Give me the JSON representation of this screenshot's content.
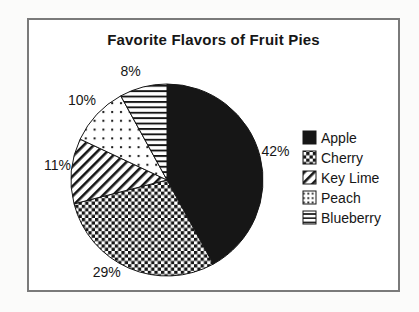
{
  "chart_data": {
    "type": "pie",
    "title": "Favorite Flavors of Fruit Pies",
    "direction": "clockwise",
    "start_angle_deg": 0,
    "legend_position": "right",
    "total_percent": 100,
    "series": [
      {
        "name": "Apple",
        "value": 42,
        "label": "42%",
        "pattern": "solid"
      },
      {
        "name": "Cherry",
        "value": 29,
        "label": "29%",
        "pattern": "checker"
      },
      {
        "name": "Key Lime",
        "value": 11,
        "label": "11%",
        "pattern": "diagonal"
      },
      {
        "name": "Peach",
        "value": 10,
        "label": "10%",
        "pattern": "dots"
      },
      {
        "name": "Blueberry",
        "value": 8,
        "label": "8%",
        "pattern": "hlines"
      }
    ],
    "colors": {
      "ink": "#161616",
      "background": "#ffffff",
      "frame_border": "#7a7a7a"
    }
  }
}
